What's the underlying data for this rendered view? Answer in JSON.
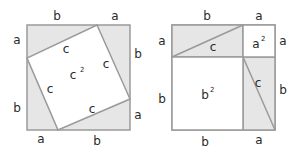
{
  "colors": {
    "stroke": "#9a9a9a",
    "shaded": "#e6e6e6",
    "white": "#ffffff",
    "text": "#2a2a2a"
  },
  "left_figure": {
    "outer_labels": {
      "top_b": "b",
      "top_a": "a",
      "right_b": "b",
      "right_a": "a",
      "bottom_a": "a",
      "bottom_b": "b",
      "left_a": "a",
      "left_b": "b"
    },
    "inner_labels": {
      "c_top": "c",
      "c_right": "c",
      "c_left": "c",
      "c_bottom": "c",
      "area_base": "c",
      "area_exp": "2"
    }
  },
  "right_figure": {
    "outer_labels": {
      "top_b": "b",
      "top_a": "a",
      "right_a": "a",
      "right_b": "b",
      "bottom_b": "b",
      "bottom_a": "a",
      "left_a": "a",
      "left_b": "b"
    },
    "inner_labels": {
      "c_top": "c",
      "c_right": "c",
      "a_sq_base": "a",
      "a_sq_exp": "2",
      "b_sq_base": "b",
      "b_sq_exp": "2"
    }
  }
}
